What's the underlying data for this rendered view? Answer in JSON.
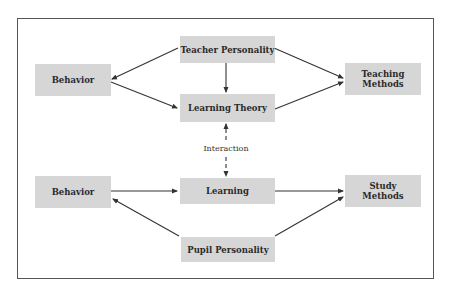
{
  "diagram": {
    "nodes": {
      "teacher_personality": "Teacher Personality",
      "behavior_top": "Behavior",
      "teaching_methods_1": "Teaching",
      "teaching_methods_2": "Methods",
      "learning_theory": "Learning Theory",
      "behavior_bottom": "Behavior",
      "learning": "Learning",
      "study_methods_1": "Study",
      "study_methods_2": "Methods",
      "pupil_personality": "Pupil Personality"
    },
    "interaction_label": "Interaction",
    "edges": [
      {
        "from": "Teacher Personality",
        "to": "Behavior (top)",
        "style": "solid"
      },
      {
        "from": "Teacher Personality",
        "to": "Learning Theory",
        "style": "solid"
      },
      {
        "from": "Teacher Personality",
        "to": "Teaching Methods",
        "style": "solid"
      },
      {
        "from": "Behavior (top)",
        "to": "Learning Theory",
        "style": "solid"
      },
      {
        "from": "Learning Theory",
        "to": "Teaching Methods",
        "style": "solid"
      },
      {
        "from": "Learning Theory",
        "to": "Learning",
        "style": "dashed-bidirectional",
        "label": "Interaction"
      },
      {
        "from": "Behavior (bottom)",
        "to": "Learning",
        "style": "solid"
      },
      {
        "from": "Learning",
        "to": "Study Methods",
        "style": "solid"
      },
      {
        "from": "Pupil Personality",
        "to": "Behavior (bottom)",
        "style": "solid"
      },
      {
        "from": "Pupil Personality",
        "to": "Study Methods",
        "style": "solid"
      }
    ],
    "colors": {
      "node_fill": "#d6d6d6",
      "line": "#333333",
      "frame": "#555555"
    }
  }
}
